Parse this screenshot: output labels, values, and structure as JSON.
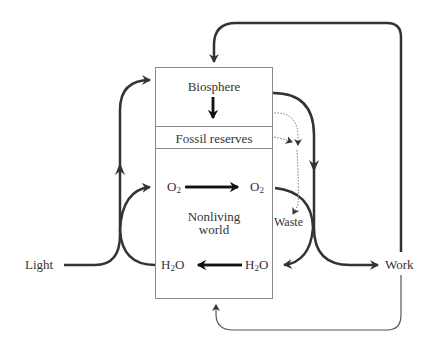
{
  "diagram": {
    "boxes": {
      "biosphere": "Biosphere",
      "fossil_reserves": "Fossil reserves",
      "nonliving_world_line1": "Nonliving",
      "nonliving_world_line2": "world"
    },
    "species": {
      "o2_left": {
        "base": "O",
        "sub": "2"
      },
      "o2_right": {
        "base": "O",
        "sub": "2"
      },
      "h2o_left": {
        "base": "H",
        "sub": "2",
        "tail": "O"
      },
      "h2o_right": {
        "base": "H",
        "sub": "2",
        "tail": "O"
      }
    },
    "external_labels": {
      "light": "Light",
      "work": "Work",
      "waste": "Waste"
    },
    "colors": {
      "arrow": "#333333",
      "thin_line": "#555555",
      "box_border": "#888888",
      "dotted": "#777777"
    }
  }
}
